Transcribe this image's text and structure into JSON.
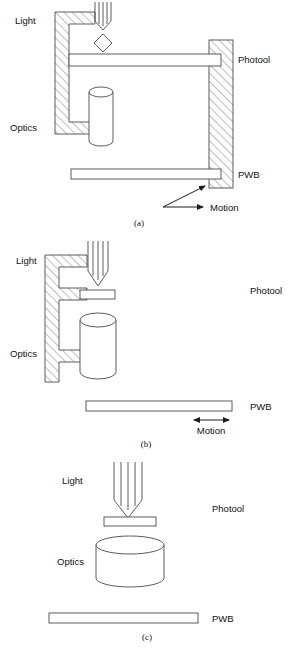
{
  "figure": {
    "title_alt": "Three exposure configurations of photool, optics and PWB",
    "stroke_color": "#3a3a3a",
    "fill_color": "#ffffff",
    "hatch_color": "#6e6e6e",
    "text_color": "#111111",
    "panels": [
      {
        "id": "a",
        "caption": "(a)",
        "labels": {
          "light": "Light",
          "optics": "Optics",
          "photool": "Photool",
          "pwb": "PWB",
          "motion": "Motion"
        },
        "motion_arrow": "single-headed-right-with-pointer",
        "optics_shape": "tall-cylinder",
        "beam_lines": 5
      },
      {
        "id": "b",
        "caption": "(b)",
        "labels": {
          "light": "Light",
          "optics": "Optics",
          "photool": "Photool",
          "pwb": "PWB",
          "motion": "Motion"
        },
        "motion_arrow": "double-headed-horizontal",
        "optics_shape": "medium-cylinder",
        "beam_lines": 5
      },
      {
        "id": "c",
        "caption": "(c)",
        "labels": {
          "light": "Light",
          "optics": "Optics",
          "photool": "Photool",
          "pwb": "PWB"
        },
        "motion_arrow": "none",
        "optics_shape": "wide-cylinder",
        "beam_lines": 5
      }
    ]
  }
}
